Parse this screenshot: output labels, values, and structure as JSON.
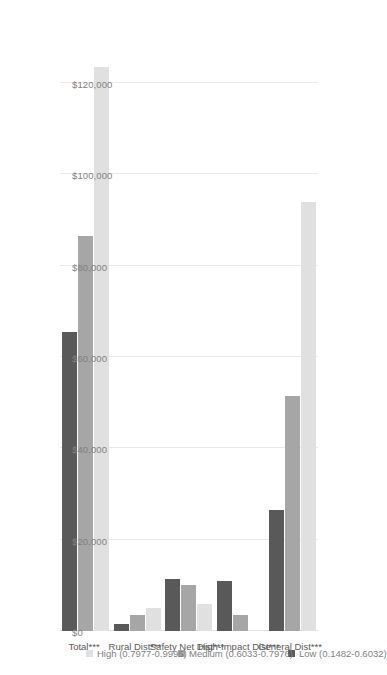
{
  "chart_data": {
    "type": "bar",
    "orientation": "horizontal",
    "title": "",
    "subtitle": "",
    "xlabel": "",
    "ylabel": "",
    "xlim": [
      0,
      120000
    ],
    "axis_tick_labels": [
      "$120,000",
      "$100,000",
      "$80,000",
      "$60,000",
      "$40,000",
      "$20,000",
      "$0"
    ],
    "axis_tick_values": [
      120000,
      100000,
      80000,
      60000,
      40000,
      20000,
      0
    ],
    "grid": true,
    "legend_position": "right",
    "categories": [
      "General Dist***",
      "High-Impact Dist***",
      "Safety Net Dist***",
      "Rural Dist***",
      "Total***"
    ],
    "series": [
      {
        "name": "Low (0.1482-0.6032)",
        "color": "#595959",
        "values": [
          26500,
          11000,
          11500,
          1500,
          65500
        ]
      },
      {
        "name": "Medium (0.6033-0.7976)",
        "color": "#a6a6a6",
        "values": [
          51500,
          3500,
          10000,
          3500,
          86500
        ]
      },
      {
        "name": "High (0.7977-0.9995)",
        "color": "#e0e0e0",
        "values": [
          94000,
          0,
          6000,
          5000,
          123500
        ]
      }
    ]
  },
  "colors": {
    "low": "#595959",
    "medium": "#a6a6a6",
    "high": "#e0e0e0",
    "gridline": "#e8e8e8",
    "tick_text": "#808080",
    "category_text": "#595959",
    "background": "#ffffff"
  }
}
